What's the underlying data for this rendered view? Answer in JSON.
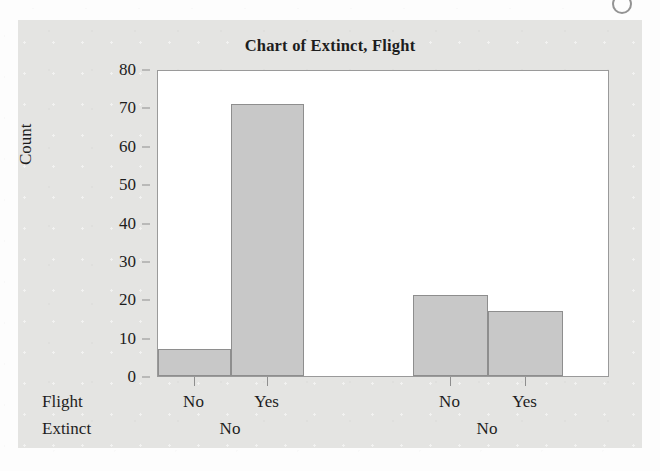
{
  "figure": {
    "title": "Chart of Extinct, Flight",
    "corner_mark": "scan-artifact"
  },
  "chart_data": {
    "type": "bar",
    "title": "Chart of Extinct, Flight",
    "xlabel": "",
    "ylabel": "Count",
    "ylim": [
      0,
      80
    ],
    "ytick_labels": [
      "80",
      "70",
      "60",
      "50",
      "40",
      "30",
      "20",
      "10",
      "0"
    ],
    "ytick_values": [
      80,
      70,
      60,
      50,
      40,
      30,
      20,
      10,
      0
    ],
    "grid": false,
    "legend": "none",
    "bar_fill_color": "#c8c8c8",
    "bar_edge_color": "#8e8e8e",
    "panel_color": "#e4e4e2",
    "plot_bg_color": "#ffffff",
    "axis_factor_names": [
      "Flight",
      "Extinct"
    ],
    "groups": [
      {
        "outer_label": "No",
        "categories": [
          "No",
          "Yes"
        ],
        "values": [
          7,
          71
        ]
      },
      {
        "outer_label": "No",
        "categories": [
          "No",
          "Yes"
        ],
        "values": [
          21,
          17
        ]
      }
    ],
    "categories": [
      "No",
      "Yes",
      "No",
      "Yes"
    ],
    "values": [
      7,
      71,
      21,
      17
    ]
  },
  "axis_rows": {
    "flight_name": "Flight",
    "extinct_name": "Extinct",
    "flight_levels": [
      "No",
      "Yes",
      "No",
      "Yes"
    ],
    "extinct_levels": [
      "No",
      "No"
    ]
  }
}
